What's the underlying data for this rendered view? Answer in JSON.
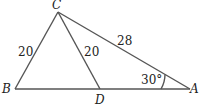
{
  "diagram": {
    "points": {
      "A": {
        "label": "A",
        "x": 190,
        "y": 89
      },
      "B": {
        "label": "B",
        "x": 15,
        "y": 89
      },
      "C": {
        "label": "C",
        "x": 58,
        "y": 12
      },
      "D": {
        "label": "D",
        "x": 100,
        "y": 89
      }
    },
    "segments": {
      "BC": {
        "length_label": "20"
      },
      "CD": {
        "length_label": "20"
      },
      "CA": {
        "length_label": "28"
      },
      "BA": {
        "length_label": ""
      }
    },
    "angles": {
      "A": {
        "label": "30°"
      }
    },
    "line_color": "#555555"
  }
}
